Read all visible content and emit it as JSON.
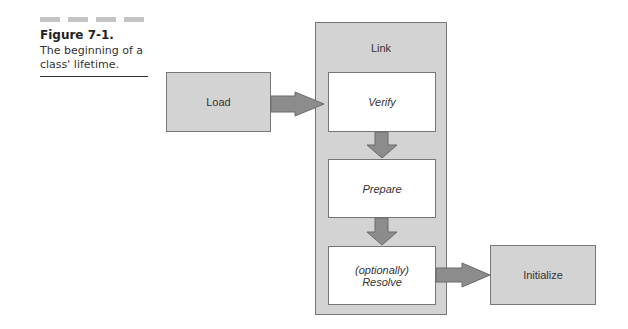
{
  "figure": {
    "title": "Figure 7-1.",
    "description": "The beginning of a class' lifetime."
  },
  "diagram": {
    "load": "Load",
    "link": "Link",
    "verify": "Verify",
    "prepare": "Prepare",
    "resolve_line1": "(optionally)",
    "resolve_line2": "Resolve",
    "initialize": "Initialize"
  },
  "colors": {
    "box_gray": "#d3d3d3",
    "arrow_gray": "#8c8c8c",
    "border": "#777777"
  }
}
